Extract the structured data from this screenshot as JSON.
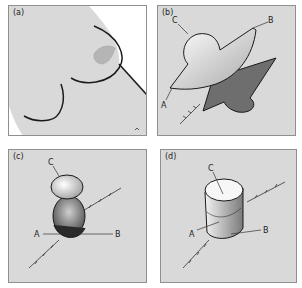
{
  "figure": {
    "panels": [
      {
        "id": "a",
        "label": "(a)",
        "callouts": []
      },
      {
        "id": "b",
        "label": "(b)",
        "callouts": [
          "A",
          "B",
          "C"
        ]
      },
      {
        "id": "c",
        "label": "(c)",
        "callouts": [
          "A",
          "B",
          "C"
        ]
      },
      {
        "id": "d",
        "label": "(d)",
        "callouts": [
          "A",
          "B",
          "C"
        ]
      }
    ],
    "colors": {
      "panel_bg": "#d9d9d9",
      "panel_border": "#8f8f8f",
      "outline": "#1a1a1a",
      "shape_light": "#f4f4f4",
      "shape_dark": "#6e6e6e"
    }
  }
}
